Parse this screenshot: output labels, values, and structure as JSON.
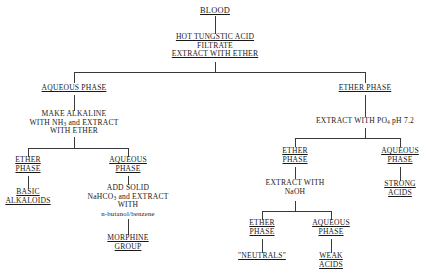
{
  "diagram": {
    "title": "BLOOD",
    "type": "flowchart",
    "nodes": {
      "blood": {
        "label": "BLOOD",
        "underlined": true
      },
      "tungstic": {
        "line1": "HOT TUNGSTIC ACID",
        "line2": "FILTRATE",
        "line3": "EXTRACT WITH ETHER"
      },
      "aqueous_phase_1": {
        "label": "AQUEOUS PHASE",
        "underlined": true
      },
      "ether_phase_1": {
        "label": "ETHER PHASE",
        "underlined": true
      },
      "make_alkaline": {
        "line1": "MAKE ALKALINE",
        "line2a": "WITH NH",
        "line2sub": "3",
        "line2b": " and EXTRACT",
        "line3": "WITH ETHER"
      },
      "ether_phase_2": {
        "line1": "ETHER",
        "line2": "PHASE"
      },
      "aqueous_phase_2": {
        "line1": "AQUEOUS",
        "line2": "PHASE"
      },
      "basic_alkaloids": {
        "line1": "BASIC",
        "line2": "ALKALOIDS"
      },
      "add_solid": {
        "line1": "ADD SOLID",
        "line2a": "NaHCO",
        "line2sub": "3",
        "line2b": " and EXTRACT",
        "line3": "WITH",
        "line4": "n-butanol/benzene"
      },
      "morphine_group": {
        "line1": "MORPHINE",
        "line2": "GROUP"
      },
      "extract_po4": {
        "pre": "EXTRACT WITH PO",
        "sub": "4",
        "post": " pH 7.2"
      },
      "ether_phase_3": {
        "line1": "ETHER",
        "line2": "PHASE"
      },
      "aqueous_phase_3": {
        "line1": "AQUEOUS",
        "line2": "PHASE"
      },
      "strong_acids": {
        "line1": "STRONG",
        "line2": "ACIDS"
      },
      "extract_naoh": {
        "line1": "EXTRACT WITH",
        "line2": "NaOH"
      },
      "ether_phase_4": {
        "line1": "ETHER",
        "line2": "PHASE"
      },
      "aqueous_phase_4": {
        "line1": "AQUEOUS",
        "line2": "PHASE"
      },
      "neutrals": {
        "label": "\"NEUTRALS\""
      },
      "weak_acids": {
        "line1": "WEAK",
        "line2": "ACIDS"
      }
    },
    "colors": {
      "background": "#ffffff",
      "text": "#1a1a1a",
      "connector": "#3a3a3a"
    }
  }
}
